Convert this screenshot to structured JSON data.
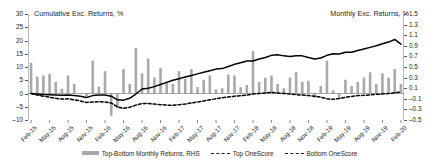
{
  "chart_data": {
    "type": "bar",
    "title": "",
    "left_axis": {
      "label": "Cumulative Exc. Returns, %",
      "ticks": [
        30,
        25,
        20,
        15,
        10,
        5,
        0,
        -5,
        -10
      ],
      "min": -10,
      "max": 30
    },
    "right_axis": {
      "label": "Monthly Exc. Returns, %",
      "ticks": [
        1.5,
        1.3,
        1.1,
        0.9,
        0.7,
        0.5,
        0.3,
        0.1,
        -0.1,
        -0.3,
        -0.5
      ],
      "min": -0.5,
      "max": 1.5
    },
    "xlabel": "",
    "grid": false,
    "legend_position": "bottom",
    "categories": [
      "Feb-15",
      "Mar-15",
      "Apr-15",
      "May-15",
      "Jun-15",
      "Jul-15",
      "Aug-15",
      "Sep-15",
      "Oct-15",
      "Nov-15",
      "Dec-15",
      "Jan-16",
      "Feb-16",
      "Mar-16",
      "Apr-16",
      "May-16",
      "Jun-16",
      "Jul-16",
      "Aug-16",
      "Sep-16",
      "Oct-16",
      "Nov-16",
      "Dec-16",
      "Jan-17",
      "Feb-17",
      "Mar-17",
      "Apr-17",
      "May-17",
      "Jun-17",
      "Jul-17",
      "Aug-17",
      "Sep-17",
      "Oct-17",
      "Nov-17",
      "Dec-17",
      "Jan-18",
      "Feb-18",
      "Mar-18",
      "Apr-18",
      "May-18",
      "Jun-18",
      "Jul-18",
      "Aug-18",
      "Sep-18",
      "Oct-18",
      "Nov-18",
      "Dec-18",
      "Jan-19",
      "Feb-19",
      "Mar-19",
      "Apr-19",
      "May-19",
      "Jun-19",
      "Jul-19",
      "Aug-19",
      "Sep-19",
      "Oct-19",
      "Nov-19",
      "Dec-19",
      "Jan-20",
      "Feb-20"
    ],
    "xtick_labels": [
      "Feb-15",
      "May-15",
      "Aug-15",
      "Nov-15",
      "Feb-16",
      "May-16",
      "Aug-16",
      "Nov-16",
      "Feb-17",
      "May-17",
      "Aug-17",
      "Nov-17",
      "Feb-18",
      "May-18",
      "Aug-18",
      "Nov-18",
      "Feb-19",
      "May-19",
      "Aug-19",
      "Nov-19",
      "Feb-20"
    ],
    "xtick_indices": [
      0,
      3,
      6,
      9,
      12,
      15,
      18,
      21,
      24,
      27,
      30,
      33,
      36,
      39,
      42,
      45,
      48,
      51,
      54,
      57,
      60
    ],
    "series": [
      {
        "name": "Top-Bottom Monthly Returns, RHS",
        "type": "bar",
        "axis": "right",
        "color": "#a7a9ac",
        "values": [
          0.58,
          0.32,
          0.34,
          0.37,
          0.22,
          0.09,
          0.34,
          0.18,
          0.0,
          -0.05,
          0.62,
          0.13,
          0.42,
          -0.42,
          -0.28,
          0.46,
          0.18,
          0.86,
          0.38,
          0.66,
          0.3,
          0.48,
          0.22,
          0.18,
          0.42,
          0.28,
          0.46,
          0.12,
          0.26,
          0.34,
          0.08,
          0.1,
          0.36,
          0.34,
          0.12,
          0.16,
          0.8,
          0.22,
          0.3,
          0.34,
          0.18,
          0.1,
          0.3,
          0.4,
          0.22,
          0.24,
          -0.08,
          0.14,
          0.62,
          0.06,
          -0.1,
          0.26,
          0.14,
          0.22,
          0.3,
          0.4,
          0.18,
          0.38,
          0.3,
          0.46,
          0.18
        ]
      },
      {
        "name": "Top OneScore",
        "type": "line",
        "style": "solid",
        "axis": "left",
        "color": "#000000",
        "values": [
          0.0,
          -0.2,
          -0.4,
          -0.5,
          -0.6,
          -0.7,
          -0.6,
          -0.8,
          -1.0,
          -1.5,
          -0.8,
          -0.6,
          -0.6,
          -1.0,
          -2.4,
          -2.5,
          -1.8,
          -0.2,
          1.7,
          2.0,
          2.6,
          3.4,
          4.2,
          5.0,
          5.6,
          6.2,
          6.8,
          7.4,
          8.0,
          8.6,
          9.2,
          9.4,
          10.2,
          11.0,
          11.6,
          12.3,
          12.3,
          13.0,
          13.6,
          14.4,
          14.6,
          14.2,
          14.0,
          14.2,
          14.2,
          13.6,
          13.0,
          13.4,
          14.4,
          15.0,
          14.9,
          15.6,
          15.6,
          16.2,
          16.8,
          17.4,
          18.0,
          18.8,
          19.4,
          20.4,
          18.6
        ]
      },
      {
        "name": "Bottom OneScore",
        "type": "line",
        "style": "dashed",
        "axis": "left",
        "color": "#000000",
        "values": [
          0.0,
          -0.6,
          -1.0,
          -1.4,
          -1.8,
          -2.1,
          -2.0,
          -2.4,
          -2.8,
          -3.4,
          -3.2,
          -3.1,
          -3.2,
          -3.6,
          -5.0,
          -5.6,
          -5.2,
          -4.4,
          -3.8,
          -3.8,
          -4.0,
          -4.2,
          -4.4,
          -4.4,
          -4.2,
          -4.0,
          -3.6,
          -3.2,
          -2.8,
          -2.4,
          -2.0,
          -1.6,
          -1.3,
          -1.0,
          -0.8,
          -0.6,
          -0.2,
          0.0,
          0.2,
          0.4,
          0.2,
          0.0,
          -0.2,
          -0.4,
          -0.6,
          -0.8,
          -1.0,
          -1.4,
          -2.0,
          -2.2,
          -1.9,
          -1.4,
          -1.1,
          -0.8,
          -0.7,
          -0.5,
          -0.3,
          -0.2,
          0.0,
          0.3,
          0.5
        ]
      }
    ]
  },
  "legend": {
    "items": [
      {
        "label": "Top-Bottom Monthly Returns, RHS",
        "marker": "bar-swatch"
      },
      {
        "label": "Top OneScore",
        "marker": "dash-swatch"
      },
      {
        "label": "Bottom OneScore",
        "marker": "dash-swatch"
      }
    ]
  }
}
